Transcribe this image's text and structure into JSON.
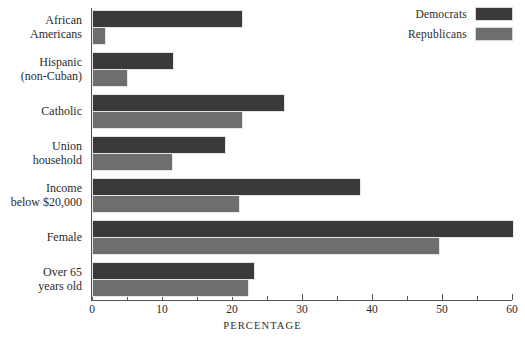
{
  "chart_data": {
    "type": "bar",
    "orientation": "horizontal",
    "title": "",
    "xlabel": "PERCENTAGE",
    "ylabel": "",
    "xlim": [
      0,
      60
    ],
    "xticks": [
      0,
      10,
      20,
      30,
      40,
      50,
      60
    ],
    "xtick_labels": [
      "0",
      "10",
      "20",
      "30",
      "40",
      "50",
      "60"
    ],
    "minor_tick_step": 5,
    "grid": false,
    "legend_position": "top-right",
    "categories": [
      "African Americans",
      "Hispanic (non-Cuban)",
      "Catholic",
      "Union household",
      "Income below $20,000",
      "Female",
      "Over 65 years old"
    ],
    "category_lines": [
      [
        "African",
        "Americans"
      ],
      [
        "Hispanic",
        "(non-Cuban)"
      ],
      [
        "Catholic"
      ],
      [
        "Union",
        "household"
      ],
      [
        "Income",
        "below $20,000"
      ],
      [
        "Female"
      ],
      [
        "Over 65",
        "years old"
      ]
    ],
    "series": [
      {
        "name": "Democrats",
        "color": "#3a3a3a",
        "values": [
          21.3,
          11.4,
          27.3,
          18.9,
          38.1,
          60.0,
          23.0
        ]
      },
      {
        "name": "Republicans",
        "color": "#6e6e6e",
        "values": [
          1.7,
          4.9,
          21.3,
          11.3,
          20.9,
          49.4,
          22.1
        ]
      }
    ]
  },
  "legend": {
    "items": [
      {
        "label": "Democrats",
        "color": "#3a3a3a"
      },
      {
        "label": "Republicans",
        "color": "#6e6e6e"
      }
    ]
  },
  "axis": {
    "x_title": "PERCENTAGE",
    "tick_labels": [
      "0",
      "10",
      "20",
      "30",
      "40",
      "50",
      "60"
    ]
  }
}
